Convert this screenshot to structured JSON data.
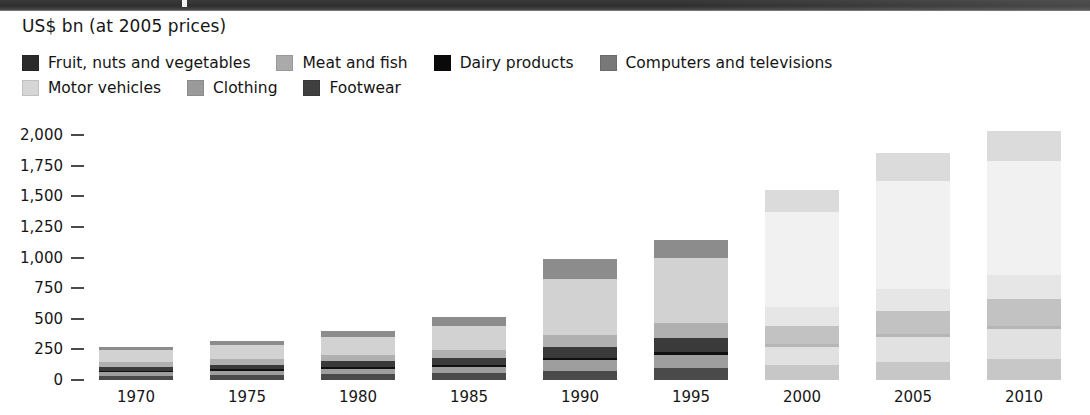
{
  "figure": {
    "unit_label": "US$ bn (at 2005 prices)"
  },
  "legend": {
    "rows": [
      [
        {
          "label": "Fruit, nuts and vegetables",
          "color": "#2b2b2b",
          "key": "fruit_nuts_vegetables"
        },
        {
          "label": "Meat and fish",
          "color": "#aaaaaa",
          "key": "meat_and_fish"
        },
        {
          "label": "Dairy products",
          "color": "#0a0a0a",
          "key": "dairy_products"
        },
        {
          "label": "Computers and televisions",
          "color": "#787878",
          "key": "computers_and_televisions"
        }
      ],
      [
        {
          "label": "Motor vehicles",
          "color": "#d6d6d6",
          "key": "motor_vehicles"
        },
        {
          "label": "Clothing",
          "color": "#9a9a9a",
          "key": "clothing"
        },
        {
          "label": "Footwear",
          "color": "#3f3f3f",
          "key": "footwear"
        }
      ]
    ]
  },
  "y_axis": {
    "ticks": [
      "2,000",
      "1,750",
      "1,500",
      "1,250",
      "1,000",
      "750",
      "500",
      "250",
      "0"
    ]
  },
  "x_axis": {
    "ticks": [
      "1970",
      "1975",
      "1980",
      "1985",
      "1990",
      "1995",
      "2000",
      "2005",
      "2010"
    ]
  },
  "chart_data": {
    "type": "bar",
    "title": "",
    "subtitle": "",
    "xlabel": "",
    "ylabel": "US$ bn (at 2005 prices)",
    "ylim": [
      0,
      2000
    ],
    "ytick_values": [
      0,
      250,
      500,
      750,
      1000,
      1250,
      1500,
      1750,
      2000
    ],
    "grid": false,
    "stacked": true,
    "legend_position": "top",
    "categories": [
      "1970",
      "1975",
      "1980",
      "1985",
      "1990",
      "1995",
      "2000",
      "2005",
      "2010"
    ],
    "series": [
      {
        "name": "Footwear",
        "color": "#3f3f3f",
        "values": [
          35,
          40,
          48,
          55,
          75,
          95,
          120,
          150,
          175
        ]
      },
      {
        "name": "Clothing",
        "color": "#9a9a9a",
        "values": [
          30,
          35,
          45,
          55,
          85,
          110,
          150,
          200,
          240
        ]
      },
      {
        "name": "Dairy products",
        "color": "#0a0a0a",
        "values": [
          12,
          13,
          15,
          16,
          20,
          22,
          25,
          28,
          30
        ]
      },
      {
        "name": "Fruit, nuts and vegetables",
        "color": "#2b2b2b",
        "values": [
          30,
          35,
          45,
          55,
          90,
          115,
          150,
          185,
          215
        ]
      },
      {
        "name": "Meat and fish",
        "color": "#aaaaaa",
        "values": [
          40,
          45,
          55,
          65,
          95,
          120,
          150,
          180,
          200
        ]
      },
      {
        "name": "Motor vehicles",
        "color": "#d6d6d6",
        "values": [
          95,
          115,
          145,
          195,
          460,
          530,
          780,
          880,
          930
        ]
      },
      {
        "name": "Computers and televisions",
        "color": "#787878",
        "values": [
          28,
          32,
          47,
          74,
          165,
          148,
          175,
          227,
          245
        ]
      }
    ],
    "totals": [
      270,
      315,
      400,
      515,
      990,
      1140,
      1550,
      1850,
      2035
    ]
  },
  "bars_render": [
    {
      "year": "1970",
      "left": 11,
      "width": 74,
      "faded": "none",
      "segments": [
        {
          "key": "footwear",
          "color": "#4a4a4a",
          "from": 0,
          "to": 35
        },
        {
          "key": "clothing",
          "color": "#9e9e9e",
          "from": 35,
          "to": 65
        },
        {
          "key": "dairy_products",
          "color": "#101010",
          "from": 65,
          "to": 77
        },
        {
          "key": "fruit_nuts_vegetables",
          "color": "#3a3a3a",
          "from": 77,
          "to": 107
        },
        {
          "key": "meat_and_fish",
          "color": "#b0b0b0",
          "from": 107,
          "to": 147
        },
        {
          "key": "motor_vehicles",
          "color": "#d2d2d2",
          "from": 147,
          "to": 242
        },
        {
          "key": "computers_and_televisions",
          "color": "#8c8c8c",
          "from": 242,
          "to": 270
        }
      ]
    },
    {
      "year": "1975",
      "left": 122,
      "width": 74,
      "faded": "none",
      "segments": [
        {
          "key": "footwear",
          "color": "#4a4a4a",
          "from": 0,
          "to": 40
        },
        {
          "key": "clothing",
          "color": "#9e9e9e",
          "from": 40,
          "to": 75
        },
        {
          "key": "dairy_products",
          "color": "#101010",
          "from": 75,
          "to": 88
        },
        {
          "key": "fruit_nuts_vegetables",
          "color": "#3a3a3a",
          "from": 88,
          "to": 123
        },
        {
          "key": "meat_and_fish",
          "color": "#b0b0b0",
          "from": 123,
          "to": 168
        },
        {
          "key": "motor_vehicles",
          "color": "#d2d2d2",
          "from": 168,
          "to": 283
        },
        {
          "key": "computers_and_televisions",
          "color": "#8c8c8c",
          "from": 283,
          "to": 315
        }
      ]
    },
    {
      "year": "1980",
      "left": 233,
      "width": 74,
      "faded": "none",
      "segments": [
        {
          "key": "footwear",
          "color": "#4a4a4a",
          "from": 0,
          "to": 48
        },
        {
          "key": "clothing",
          "color": "#9e9e9e",
          "from": 48,
          "to": 93
        },
        {
          "key": "dairy_products",
          "color": "#101010",
          "from": 93,
          "to": 108
        },
        {
          "key": "fruit_nuts_vegetables",
          "color": "#3a3a3a",
          "from": 108,
          "to": 153
        },
        {
          "key": "meat_and_fish",
          "color": "#b0b0b0",
          "from": 153,
          "to": 208
        },
        {
          "key": "motor_vehicles",
          "color": "#d2d2d2",
          "from": 208,
          "to": 353
        },
        {
          "key": "computers_and_televisions",
          "color": "#8c8c8c",
          "from": 353,
          "to": 400
        }
      ]
    },
    {
      "year": "1985",
      "left": 344,
      "width": 74,
      "faded": "none",
      "segments": [
        {
          "key": "footwear",
          "color": "#4a4a4a",
          "from": 0,
          "to": 55
        },
        {
          "key": "clothing",
          "color": "#9e9e9e",
          "from": 55,
          "to": 110
        },
        {
          "key": "dairy_products",
          "color": "#101010",
          "from": 110,
          "to": 126
        },
        {
          "key": "fruit_nuts_vegetables",
          "color": "#3a3a3a",
          "from": 126,
          "to": 181
        },
        {
          "key": "meat_and_fish",
          "color": "#b0b0b0",
          "from": 181,
          "to": 246
        },
        {
          "key": "motor_vehicles",
          "color": "#d2d2d2",
          "from": 246,
          "to": 441
        },
        {
          "key": "computers_and_televisions",
          "color": "#8c8c8c",
          "from": 441,
          "to": 515
        }
      ]
    },
    {
      "year": "1990",
      "left": 455,
      "width": 74,
      "faded": "none",
      "segments": [
        {
          "key": "footwear",
          "color": "#4a4a4a",
          "from": 0,
          "to": 75
        },
        {
          "key": "clothing",
          "color": "#9e9e9e",
          "from": 75,
          "to": 160
        },
        {
          "key": "dairy_products",
          "color": "#101010",
          "from": 160,
          "to": 180
        },
        {
          "key": "fruit_nuts_vegetables",
          "color": "#3a3a3a",
          "from": 180,
          "to": 270
        },
        {
          "key": "meat_and_fish",
          "color": "#b0b0b0",
          "from": 270,
          "to": 365
        },
        {
          "key": "motor_vehicles",
          "color": "#d2d2d2",
          "from": 365,
          "to": 825
        },
        {
          "key": "computers_and_televisions",
          "color": "#8c8c8c",
          "from": 825,
          "to": 990
        }
      ]
    },
    {
      "year": "1995",
      "left": 566,
      "width": 74,
      "faded": "none",
      "segments": [
        {
          "key": "footwear",
          "color": "#4a4a4a",
          "from": 0,
          "to": 95
        },
        {
          "key": "clothing",
          "color": "#9e9e9e",
          "from": 95,
          "to": 205
        },
        {
          "key": "dairy_products",
          "color": "#101010",
          "from": 205,
          "to": 227
        },
        {
          "key": "fruit_nuts_vegetables",
          "color": "#3a3a3a",
          "from": 227,
          "to": 342
        },
        {
          "key": "meat_and_fish",
          "color": "#b0b0b0",
          "from": 342,
          "to": 462
        },
        {
          "key": "motor_vehicles",
          "color": "#d2d2d2",
          "from": 462,
          "to": 992
        },
        {
          "key": "computers_and_televisions",
          "color": "#8c8c8c",
          "from": 992,
          "to": 1140
        }
      ]
    },
    {
      "year": "2000",
      "left": 677,
      "width": 74,
      "faded": "full",
      "segments": [
        {
          "key": "footwear",
          "color": "#4a4a4a",
          "from": 0,
          "to": 120
        },
        {
          "key": "clothing",
          "color": "#9e9e9e",
          "from": 120,
          "to": 270
        },
        {
          "key": "dairy_products",
          "color": "#101010",
          "from": 270,
          "to": 295
        },
        {
          "key": "fruit_nuts_vegetables",
          "color": "#3a3a3a",
          "from": 295,
          "to": 445
        },
        {
          "key": "meat_and_fish",
          "color": "#b0b0b0",
          "from": 445,
          "to": 595
        },
        {
          "key": "motor_vehicles",
          "color": "#d2d2d2",
          "from": 595,
          "to": 1375
        },
        {
          "key": "computers_and_televisions",
          "color": "#8c8c8c",
          "from": 1375,
          "to": 1550
        }
      ]
    },
    {
      "year": "2005",
      "left": 788,
      "width": 74,
      "faded": "full",
      "segments": [
        {
          "key": "footwear",
          "color": "#4a4a4a",
          "from": 0,
          "to": 150
        },
        {
          "key": "clothing",
          "color": "#9e9e9e",
          "from": 150,
          "to": 350
        },
        {
          "key": "dairy_products",
          "color": "#101010",
          "from": 350,
          "to": 378
        },
        {
          "key": "fruit_nuts_vegetables",
          "color": "#3a3a3a",
          "from": 378,
          "to": 563
        },
        {
          "key": "meat_and_fish",
          "color": "#b0b0b0",
          "from": 563,
          "to": 743
        },
        {
          "key": "motor_vehicles",
          "color": "#d2d2d2",
          "from": 743,
          "to": 1623
        },
        {
          "key": "computers_and_televisions",
          "color": "#8c8c8c",
          "from": 1623,
          "to": 1850
        }
      ]
    },
    {
      "year": "2010",
      "left": 899,
      "width": 74,
      "faded": "full",
      "segments": [
        {
          "key": "footwear",
          "color": "#4a4a4a",
          "from": 0,
          "to": 175
        },
        {
          "key": "clothing",
          "color": "#9e9e9e",
          "from": 175,
          "to": 415
        },
        {
          "key": "dairy_products",
          "color": "#101010",
          "from": 415,
          "to": 445
        },
        {
          "key": "fruit_nuts_vegetables",
          "color": "#3a3a3a",
          "from": 445,
          "to": 660
        },
        {
          "key": "meat_and_fish",
          "color": "#b0b0b0",
          "from": 660,
          "to": 860
        },
        {
          "key": "motor_vehicles",
          "color": "#d2d2d2",
          "from": 860,
          "to": 1790
        },
        {
          "key": "computers_and_televisions",
          "color": "#8c8c8c",
          "from": 1790,
          "to": 2035
        }
      ]
    }
  ]
}
